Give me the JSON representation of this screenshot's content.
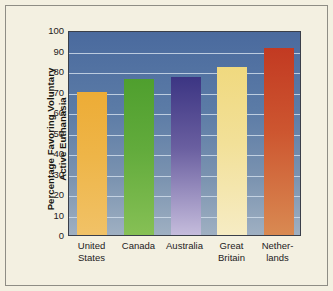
{
  "chart_data": {
    "type": "bar",
    "title": "",
    "xlabel": "",
    "ylabel": "Percentage Favoring Voluntary\nActive Euthanasia",
    "ylabel_line1": "Percentage Favoring Voluntary",
    "ylabel_line2": "Active Euthanasia",
    "categories": [
      "United\nStates",
      "Canada",
      "Australia",
      "Great\nBritain",
      "Nether-\nlands"
    ],
    "category_names": [
      "United States",
      "Canada",
      "Australia",
      "Great Britain",
      "Netherlands"
    ],
    "values": [
      70,
      76,
      77,
      82,
      91
    ],
    "ylim": [
      0,
      100
    ],
    "ytick_labels": [
      "100",
      "90",
      "80",
      "70",
      "60",
      "50",
      "40",
      "30",
      "20",
      "10",
      "0"
    ],
    "ytick_values": [
      100,
      90,
      80,
      70,
      60,
      50,
      40,
      30,
      20,
      10,
      0
    ],
    "grid": true,
    "legend": "none",
    "bar_colors": [
      "#edac36",
      "#4f9f2e",
      "#3c3583",
      "#f0d97f",
      "#c23a22"
    ],
    "plot_background": "#5b7ba6",
    "figure_background": "#f3f0e1",
    "gridline_color": "#cfdcea",
    "axis_color": "#3a3f4a"
  }
}
